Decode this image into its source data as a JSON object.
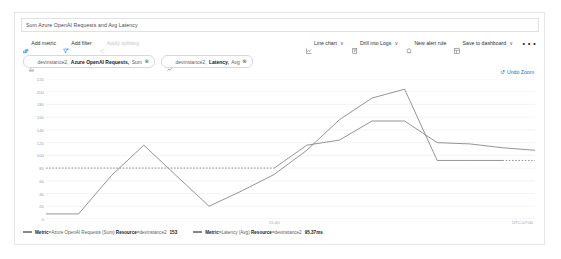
{
  "panel": {
    "title": "Sum Azure OpenAI Requests and Avg Latency"
  },
  "toolbar": {
    "add_metric": "Add metric",
    "add_filter": "Add filter",
    "apply_splitting": "Apply splitting",
    "chart_type": "Line chart",
    "drill_into_logs": "Drill into Logs",
    "new_alert_rule": "New alert rule",
    "save_to_dashboard": "Save to dashboard",
    "more": "⋯",
    "chevron": "∨"
  },
  "chips": [
    {
      "resource": "devinstance2,",
      "metric": "Azure OpenAI Requests,",
      "aggregation": "Sum",
      "remove": "⊗",
      "icon": "metric-bars-icon"
    },
    {
      "resource": "devinstance2,",
      "metric": "Latency,",
      "aggregation": "Avg",
      "remove": "⊗",
      "icon": "metric-line-icon"
    }
  ],
  "undo_zoom": {
    "label": "Undo Zoom",
    "glyph": "↺"
  },
  "legend": [
    {
      "key_label": "Metric",
      "key_value": "Azure OpenAI Requests (Sum)",
      "res_label": "Resource",
      "res_value": "devinstance2",
      "value": "153",
      "color": "#8a8886"
    },
    {
      "key_label": "Metric",
      "key_value": "Latency (Avg)",
      "res_label": "Resource",
      "res_value": "devinstance2",
      "value": "95.37ms",
      "color": "#8a8886"
    }
  ],
  "chart_data": {
    "type": "line",
    "title": "Sum Azure OpenAI Requests and Avg Latency",
    "xlabel": "",
    "ylabel": "",
    "grid": true,
    "legend_position": "bottom",
    "timezone": "UTC-07:00",
    "ylim": [
      0,
      220
    ],
    "yticks": [
      0,
      20,
      40,
      60,
      80,
      100,
      120,
      140,
      160,
      180,
      200,
      220
    ],
    "ytick_labels": [
      "0",
      "20",
      "40",
      "60",
      "80",
      "100",
      "120",
      "140",
      "160",
      "180",
      "200",
      "220"
    ],
    "x": [
      0,
      1,
      2,
      3,
      4,
      5,
      6,
      7,
      8,
      9,
      10,
      11,
      12,
      13,
      14,
      15
    ],
    "xticks": [
      7
    ],
    "xtick_labels": [
      "15:40"
    ],
    "series": [
      {
        "name": "Metric=Azure OpenAI Requests (Sum) Resource=devinstance2",
        "color": "#8a8886",
        "values": [
          8,
          8,
          68,
          116,
          68,
          20,
          44,
          70,
          108,
          156,
          190,
          204,
          92,
          92,
          92,
          92
        ],
        "dashed_tail_from": 14
      },
      {
        "name": "Metric=Latency (Avg) Resource=devinstance2",
        "color": "#8a8886",
        "values": [
          80,
          80,
          80,
          80,
          80,
          80,
          80,
          80,
          116,
          124,
          154,
          154,
          120,
          118,
          112,
          108
        ],
        "dotted_head_to": 7
      }
    ]
  }
}
